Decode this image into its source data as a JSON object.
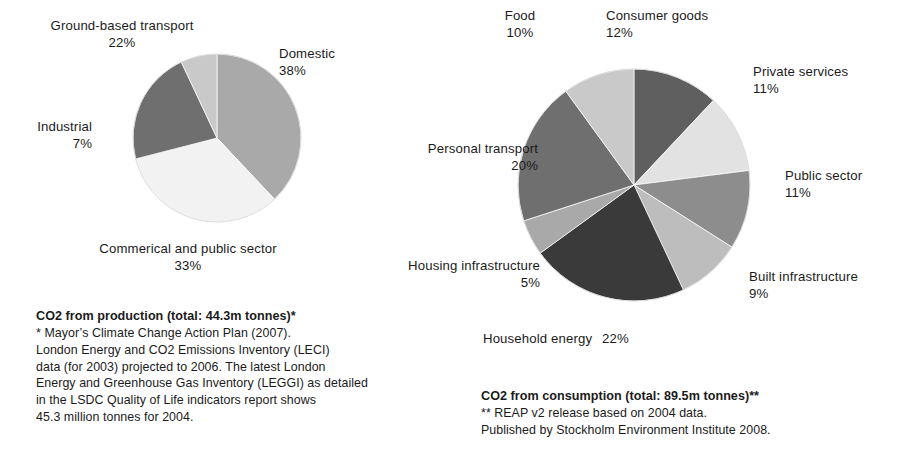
{
  "page": {
    "background": "#ffffff",
    "text_color": "#1b1b1b"
  },
  "palette": {
    "near_white": "#f2f2f2",
    "very_light_gray": "#e2e2e2",
    "light_gray": "#c9c9c9",
    "light_mid_gray": "#bdbdbd",
    "mid_gray": "#a9a9a9",
    "mid_dark_gray": "#8d8d8d",
    "dark_gray": "#6f6f6f",
    "darker_gray": "#5f5f5f",
    "very_dark_gray": "#3a3a3a",
    "outline": "#ffffff"
  },
  "production": {
    "labels": [
      {
        "name": "Domestic",
        "pct": "38%"
      },
      {
        "name": "Commerical and public sector",
        "pct": "33%"
      },
      {
        "name": "Ground-based transport",
        "pct": "22%"
      },
      {
        "name": "Industrial",
        "pct": "7%"
      }
    ],
    "caption": {
      "title": "CO2 from production (total: 44.3m tonnes)*",
      "body": "* Mayor’s Climate Change Action Plan (2007).\nLondon Energy and CO2 Emissions Inventory (LECI)\ndata (for 2003) projected to 2006. The latest London\nEnergy and Greenhouse Gas Inventory (LEGGI) as detailed\nin the LSDC Quality of Life indicators report shows\n45.3 million tonnes for 2004."
    }
  },
  "consumption": {
    "labels": [
      {
        "name": "Consumer goods",
        "pct": "12%"
      },
      {
        "name": "Private services",
        "pct": "11%"
      },
      {
        "name": "Public sector",
        "pct": "11%"
      },
      {
        "name": "Built infrastructure",
        "pct": "9%"
      },
      {
        "name": "Household energy",
        "pct": "22%"
      },
      {
        "name": "Housing infrastructure",
        "pct": "5%"
      },
      {
        "name": "Personal transport",
        "pct": "20%"
      },
      {
        "name": "Food",
        "pct": "10%"
      }
    ],
    "caption": {
      "title": "CO2 from consumption (total: 89.5m tonnes)**",
      "body": "** REAP v2 release based on 2004 data.\nPublished by Stockholm Environment Institute 2008."
    }
  },
  "chart_data": [
    {
      "type": "pie",
      "title": "CO2 from production (total: 44.3m tonnes)*",
      "total": "44.3m tonnes",
      "start_angle_deg": 0,
      "direction": "clockwise",
      "geometry": {
        "cx": 217,
        "cy": 138,
        "r": 84
      },
      "categories": [
        "Domestic",
        "Commerical and public sector",
        "Ground-based transport",
        "Industrial"
      ],
      "values": [
        38,
        33,
        22,
        7
      ],
      "unit": "%",
      "colors": [
        "#a9a9a9",
        "#f2f2f2",
        "#6f6f6f",
        "#c9c9c9"
      ],
      "legend": "labels-outside",
      "grid": false
    },
    {
      "type": "pie",
      "title": "CO2 from consumption (total: 89.5m tonnes)**",
      "total": "89.5m tonnes",
      "start_angle_deg": 0,
      "direction": "clockwise",
      "geometry": {
        "cx": 634,
        "cy": 185,
        "r": 116
      },
      "categories": [
        "Consumer goods",
        "Private services",
        "Public sector",
        "Built infrastructure",
        "Household energy",
        "Housing infrastructure",
        "Personal transport",
        "Food"
      ],
      "values": [
        12,
        11,
        11,
        9,
        22,
        5,
        20,
        10
      ],
      "unit": "%",
      "colors": [
        "#5f5f5f",
        "#e2e2e2",
        "#8d8d8d",
        "#bdbdbd",
        "#3a3a3a",
        "#a9a9a9",
        "#6f6f6f",
        "#c9c9c9"
      ],
      "legend": "labels-outside",
      "grid": false
    }
  ]
}
